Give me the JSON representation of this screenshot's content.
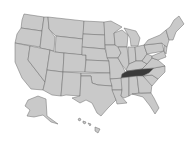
{
  "map": {
    "title": "United States map",
    "highlighted_state": "Tennessee",
    "colors": {
      "state_fill": "#c9c9c9",
      "state_border": "#6a6a6a",
      "highlight_fill": "#3a3a3a",
      "background": "#ffffff"
    },
    "regions": [
      "Contiguous United States",
      "Alaska",
      "Hawaii"
    ]
  },
  "caption": {
    "text": ""
  }
}
